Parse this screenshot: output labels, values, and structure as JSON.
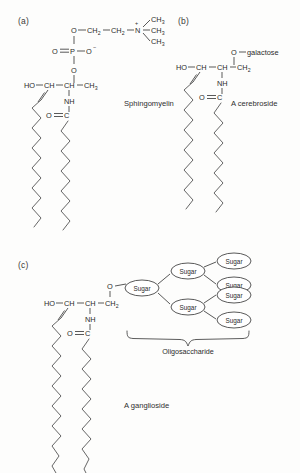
{
  "figure": {
    "background_color": "#fdfdfc",
    "line_color": "#3b3b3b"
  },
  "panels": [
    {
      "id": "a",
      "label": "(a)",
      "name": "Sphingomyelin",
      "headgroup_type": "phosphocholine",
      "atoms": {
        "hydroxyl": "HO",
        "c1": "CH",
        "c2": "CH",
        "c3": "CH",
        "c3_sub": "2",
        "amide": "NH",
        "carbonyl_o": "O",
        "carbonyl_c": "C",
        "ester_o": "O",
        "phosphorus": "P",
        "phosphoryl_o": "O",
        "phosphate_o_minus": "O",
        "phosphate_charge": "−",
        "link_o": "O",
        "ch2_a": "CH",
        "ch2_a_sub": "2",
        "ch2_b": "CH",
        "ch2_b_sub": "2",
        "nitrogen": "N",
        "nitrogen_charge": "+",
        "methyl_1": "CH",
        "methyl_1_sub": "3",
        "methyl_2": "CH",
        "methyl_2_sub": "3",
        "methyl_3": "CH",
        "methyl_3_sub": "3"
      }
    },
    {
      "id": "b",
      "label": "(b)",
      "name": "A cerebroside",
      "headgroup_type": "galactose",
      "atoms": {
        "hydroxyl": "HO",
        "c1": "CH",
        "c2": "CH",
        "c3": "CH",
        "c3_sub": "2",
        "amide": "NH",
        "carbonyl_o": "O",
        "carbonyl_c": "C",
        "link_o": "O",
        "sugar_name": "galactose"
      }
    },
    {
      "id": "c",
      "label": "(c)",
      "name": "A ganglioside",
      "headgroup_type": "oligosaccharide",
      "atoms": {
        "hydroxyl": "HO",
        "c1": "CH",
        "c2": "CH",
        "c3": "CH",
        "c3_sub": "2",
        "amide": "NH",
        "carbonyl_o": "O",
        "carbonyl_c": "C",
        "link_o": "O"
      },
      "oligosaccharide": {
        "bracket_label": "Oligosaccharide",
        "node_label": "Sugar",
        "node_count": 7,
        "topology": "root sugar branches to 2 sugars; each branch sugar connects to 2 terminal sugars"
      }
    }
  ]
}
